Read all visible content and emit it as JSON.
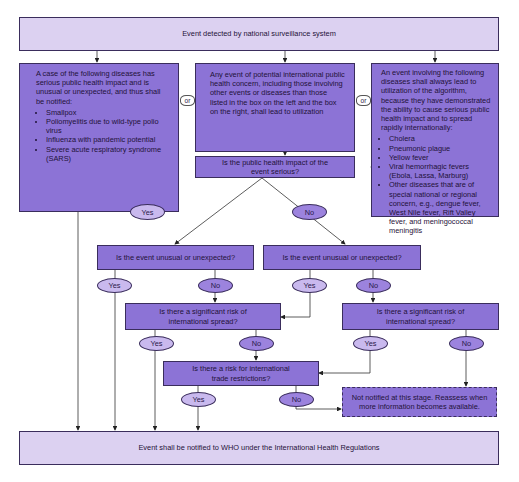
{
  "diagram": {
    "type": "flowchart",
    "colors": {
      "box": "#8c73d6",
      "light_box": "#dcd1f1",
      "yes_ellipse": "#c9b9ee",
      "no_ellipse": "#9c83de",
      "border": "#3a2d5c"
    },
    "top": {
      "text": "Event detected by national surveillance system"
    },
    "left": {
      "intro": "A case of the following diseases has serious public health impact and is unusual or unexpected, and thus shall be notified:",
      "items": [
        "Smallpox",
        "Poliomyelitis due to wild-type polio virus",
        "Influenza with pandemic potential",
        "Severe acute respiratory syndrome (SARS)"
      ]
    },
    "or_label": "or",
    "middle": {
      "text": "Any event of potential international public health concern, including those involving other events or diseases than those listed in the box on the left and the box on the right, shall lead to utilization"
    },
    "right": {
      "intro": "An event involving the following diseases shall always lead to utilization of the algorithm, because they have demonstrated the ability to cause serious public health impact and to spread rapidly internationally:",
      "items": [
        "Cholera",
        "Pneumonic plague",
        "Yellow fever",
        "Viral hemorrhagic fevers (Ebola, Lassa, Marburg)",
        "Other diseases that are of special national or regional concern, e.g., dengue fever, West Nile fever, Rift Valley fever, and meningococcal meningitis"
      ]
    },
    "q1": {
      "text": "Is the public health impact of the event serious?"
    },
    "q2_left": {
      "text": "Is the event unusual or unexpected?"
    },
    "q2_right": {
      "text": "Is the event unusual or unexpected?"
    },
    "q3_left": {
      "text": "Is there a significant risk of international spread?"
    },
    "q3_right": {
      "text": "Is there a significant risk of international spread?"
    },
    "q4": {
      "text": "Is there a risk for international trade restrictions?"
    },
    "not_notified": {
      "text": "Not notified at this stage. Reassess when more information becomes available."
    },
    "bottom": {
      "text": "Event shall be notified to WHO under the International Health Regulations"
    },
    "answers": {
      "yes": "Yes",
      "no": "No"
    }
  }
}
